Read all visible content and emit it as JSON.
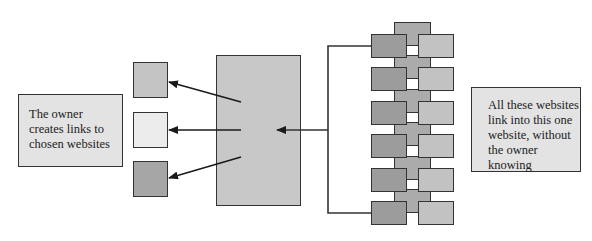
{
  "diagram": {
    "left_note": {
      "lines": [
        "The owner",
        "creates links to",
        "chosen websites"
      ]
    },
    "right_note": {
      "lines": [
        "All these websites",
        "link into this one",
        "website, without",
        "the owner knowing"
      ]
    },
    "outgoing_link_targets": [
      {
        "name": "target-site-1",
        "color": "#c4c4c4"
      },
      {
        "name": "target-site-2",
        "color": "#ececec"
      },
      {
        "name": "target-site-3",
        "color": "#a6a6a6"
      }
    ],
    "owner_website": {
      "color": "#c8c8c8"
    },
    "linking_websites": {
      "rows": 6,
      "colors": {
        "left": "#9c9c9c",
        "middle": "#ababab",
        "right": "#c2c2c2"
      }
    },
    "colors": {
      "stroke": "#333333",
      "note_bg": "#e3e3e3"
    }
  }
}
